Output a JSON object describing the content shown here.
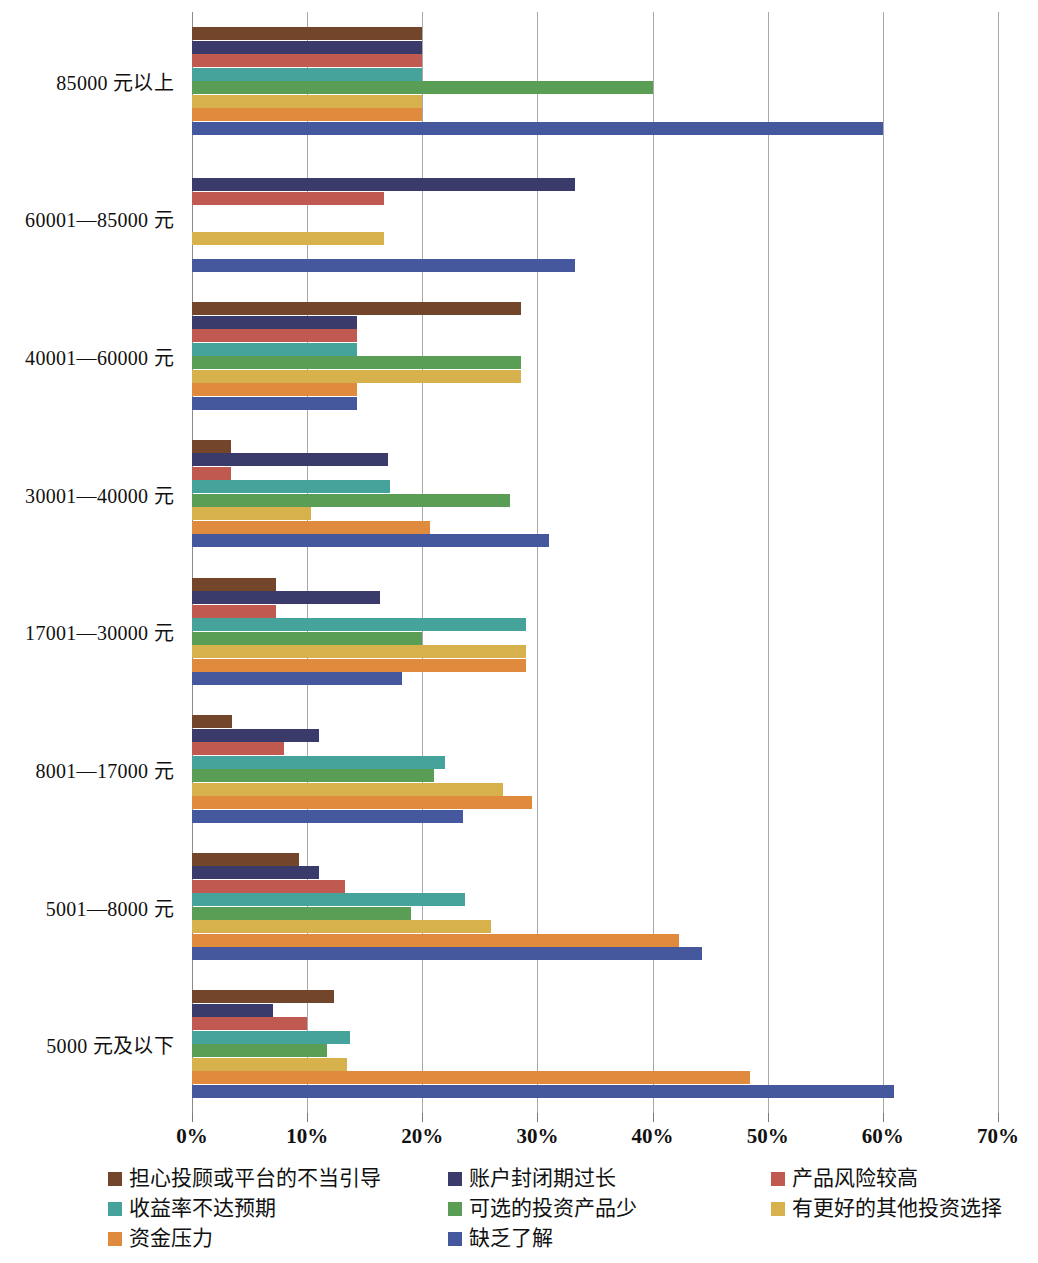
{
  "chart_data": {
    "type": "bar",
    "orientation": "horizontal",
    "title": "",
    "xlabel": "",
    "ylabel": "",
    "xlim": [
      0,
      70
    ],
    "xtick_labels": [
      "0%",
      "10%",
      "20%",
      "30%",
      "40%",
      "50%",
      "60%",
      "70%"
    ],
    "xticks": [
      0,
      10,
      20,
      30,
      40,
      50,
      60,
      70
    ],
    "grid": true,
    "legend_position": "bottom",
    "categories": [
      "85000 元以上",
      "60001—85000 元",
      "40001—60000 元",
      "30001—40000 元",
      "17001—30000 元",
      "8001—17000 元",
      "5001—8000 元",
      "5000 元及以下"
    ],
    "series": [
      {
        "name": "担心投顾或平台的不当引导",
        "color": "#73452A",
        "values": [
          20.0,
          0.0,
          28.6,
          3.4,
          7.3,
          3.5,
          9.3,
          12.3
        ]
      },
      {
        "name": "账户封闭期过长",
        "color": "#3B3B6B",
        "values": [
          20.0,
          33.3,
          14.3,
          17.0,
          16.3,
          11.0,
          11.0,
          7.0
        ]
      },
      {
        "name": "产品风险较高",
        "color": "#C05A50",
        "values": [
          20.0,
          16.7,
          14.3,
          3.4,
          7.3,
          8.0,
          13.3,
          10.0
        ]
      },
      {
        "name": "收益率不达预期",
        "color": "#46A39C",
        "values": [
          20.0,
          0.0,
          14.3,
          17.2,
          29.0,
          22.0,
          23.7,
          13.7
        ]
      },
      {
        "name": "可选的投资产品少",
        "color": "#5A9E56",
        "values": [
          40.0,
          0.0,
          28.6,
          27.6,
          20.0,
          21.0,
          19.0,
          11.7
        ]
      },
      {
        "name": "有更好的其他投资选择",
        "color": "#D7B24C",
        "values": [
          20.0,
          16.7,
          28.6,
          10.3,
          29.0,
          27.0,
          26.0,
          13.5
        ]
      },
      {
        "name": "资金压力",
        "color": "#E08A3E",
        "values": [
          20.0,
          0.0,
          14.3,
          20.7,
          29.0,
          29.5,
          42.3,
          48.5
        ]
      },
      {
        "name": "缺乏了解",
        "color": "#45589E",
        "values": [
          60.0,
          33.3,
          14.3,
          31.0,
          18.2,
          23.5,
          44.3,
          61.0
        ]
      }
    ]
  },
  "legend": {
    "rows": [
      [
        {
          "label": "担心投顾或平台的不当引导",
          "color": "#73452A",
          "x": 0
        },
        {
          "label": "账户封闭期过长",
          "color": "#3B3B6B",
          "x": 340
        },
        {
          "label": "产品风险较高",
          "color": "#C05A50",
          "x": 663
        }
      ],
      [
        {
          "label": "收益率不达预期",
          "color": "#46A39C",
          "x": 0
        },
        {
          "label": "可选的投资产品少",
          "color": "#5A9E56",
          "x": 340
        },
        {
          "label": "有更好的其他投资选择",
          "color": "#D7B24C",
          "x": 663
        }
      ],
      [
        {
          "label": "资金压力",
          "color": "#E08A3E",
          "x": 0
        },
        {
          "label": "缺乏了解",
          "color": "#45589E",
          "x": 340
        }
      ]
    ]
  }
}
